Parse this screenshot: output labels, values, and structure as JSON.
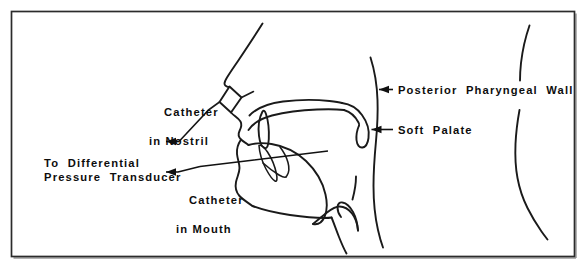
{
  "figure": {
    "type": "anatomical-line-diagram",
    "background_color": "#ffffff",
    "line_color": "#1a1a1a",
    "text_color": "#0d0d0d",
    "frame": {
      "name": "figure-border",
      "stroke_color": "#2b2b2b"
    },
    "labels": {
      "catheter_in_nostril": {
        "line1": "Catheter",
        "line2": "in Nostril"
      },
      "to_differential_pressure_transducer": {
        "line1": "To  Differential",
        "line2": "Pressure  Transducer"
      },
      "catheter_in_mouth": {
        "line1": "Catheter",
        "line2": "in Mouth"
      },
      "posterior_pharyngeal_wall": "Posterior  Pharyngeal  Wall",
      "soft_palate": "Soft  Palate"
    },
    "annotations": [
      {
        "name": "arrow-nostril-catheter-to-transducer",
        "points_to": "left",
        "describes": "to_differential_pressure_transducer"
      },
      {
        "name": "arrow-mouth-catheter-to-transducer",
        "points_to": "left",
        "describes": "to_differential_pressure_transducer"
      },
      {
        "name": "arrow-posterior-pharyngeal-wall",
        "points_to": "left",
        "describes": "posterior_pharyngeal_wall"
      },
      {
        "name": "arrow-soft-palate",
        "points_to": "left",
        "describes": "soft_palate"
      }
    ],
    "anatomy_parts": [
      "nose-bridge-profile",
      "nostril-catheter-fitting",
      "upper-lip",
      "hard-palate",
      "soft-palate-uvula",
      "tongue",
      "lower-lip",
      "mandible-chin",
      "epiglottis",
      "posterior-pharyngeal-wall",
      "posterior-head-neck-contour"
    ]
  }
}
